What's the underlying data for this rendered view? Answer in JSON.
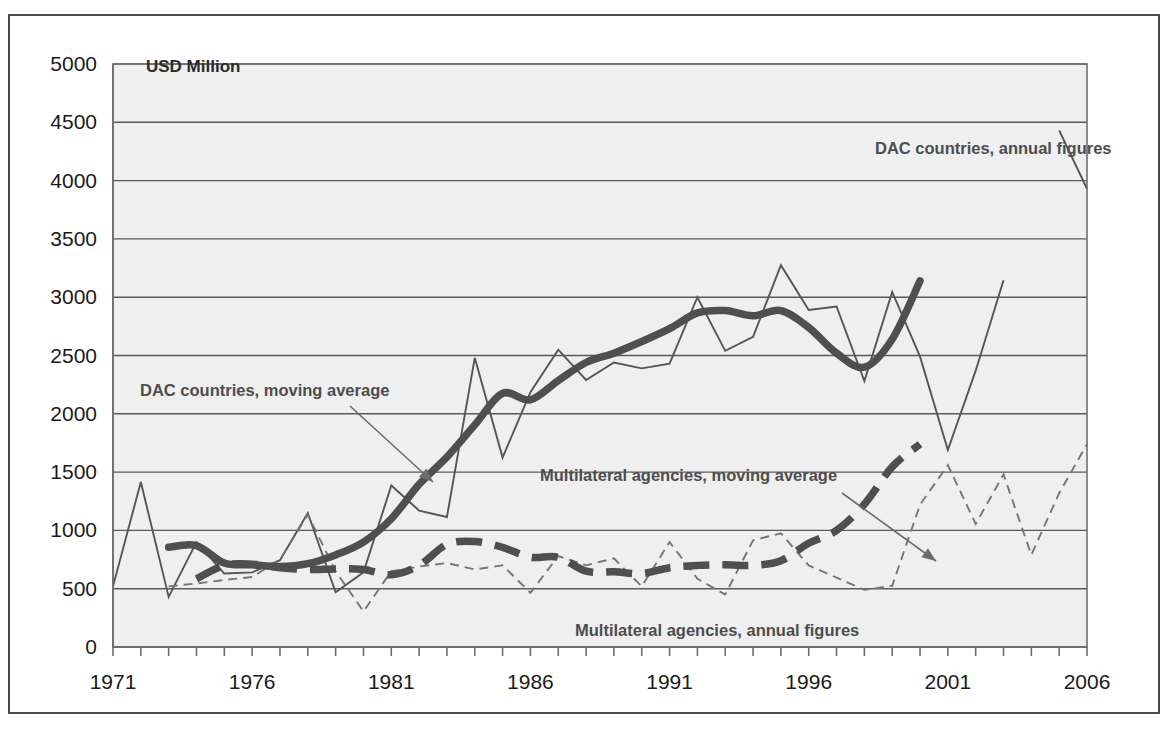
{
  "chart_data": {
    "type": "line",
    "title": "",
    "subtitle": "",
    "xlabel": "",
    "ylabel": "USD Million",
    "unit_label": "USD Million",
    "xlim": [
      1971,
      2006
    ],
    "ylim": [
      0,
      5000
    ],
    "grid": true,
    "legend_position": "inline-annotations",
    "y_ticks": [
      0,
      500,
      1000,
      1500,
      2000,
      2500,
      3000,
      3500,
      4000,
      4500,
      5000
    ],
    "y_tick_labels": [
      "0",
      "500",
      "1000",
      "1500",
      "2000",
      "2500",
      "3000",
      "3500",
      "4000",
      "4500",
      "5000"
    ],
    "x_ticks_labeled": [
      1971,
      1976,
      1981,
      1986,
      1991,
      1996,
      2001,
      2006
    ],
    "x_tick_labels": [
      "1971",
      "1976",
      "1981",
      "1986",
      "1991",
      "1996",
      "2001",
      "2006"
    ],
    "x_minor_tick_interval": 1,
    "x": [
      1971,
      1972,
      1973,
      1974,
      1975,
      1976,
      1977,
      1978,
      1979,
      1980,
      1981,
      1982,
      1983,
      1984,
      1985,
      1986,
      1987,
      1988,
      1989,
      1990,
      1991,
      1992,
      1993,
      1994,
      1995,
      1996,
      1997,
      1998,
      1999,
      2000,
      2001,
      2002,
      2003,
      2004,
      2005,
      2006
    ],
    "series": [
      {
        "name": "DAC countries, annual figures",
        "style": "thin-solid",
        "color": "#555555",
        "values": [
          520,
          1415,
          430,
          900,
          630,
          640,
          745,
          1150,
          470,
          640,
          1385,
          1170,
          1115,
          2480,
          1625,
          2185,
          2550,
          2290,
          2440,
          2390,
          2430,
          3000,
          2540,
          2660,
          3275,
          2890,
          2920,
          2280,
          3045,
          2490,
          1690,
          2370,
          3145,
          null,
          4430,
          3930
        ]
      },
      {
        "name": "DAC countries, moving average",
        "style": "thick-solid",
        "color": "#4f4f4f",
        "values": [
          null,
          null,
          855,
          870,
          720,
          705,
          690,
          715,
          790,
          900,
          1100,
          1395,
          1630,
          1905,
          2175,
          2120,
          2285,
          2440,
          2520,
          2620,
          2730,
          2865,
          2885,
          2840,
          2885,
          2740,
          2520,
          2400,
          2640,
          3140,
          null,
          null,
          null,
          null,
          null,
          null
        ]
      },
      {
        "name": "Multilateral agencies, annual figures",
        "style": "thin-dashed",
        "color": "#757575",
        "values": [
          null,
          null,
          520,
          545,
          575,
          600,
          750,
          1135,
          650,
          305,
          650,
          690,
          720,
          665,
          700,
          465,
          780,
          700,
          760,
          520,
          900,
          585,
          450,
          915,
          975,
          700,
          595,
          490,
          525,
          1220,
          1560,
          1055,
          1480,
          790,
          1320,
          1740
        ]
      },
      {
        "name": "Multilateral agencies, moving average",
        "style": "thick-dashed",
        "color": "#4f4f4f",
        "values": [
          null,
          null,
          null,
          585,
          700,
          710,
          680,
          665,
          670,
          665,
          620,
          700,
          880,
          905,
          855,
          770,
          770,
          650,
          645,
          630,
          680,
          700,
          705,
          700,
          740,
          890,
          1000,
          1225,
          1545,
          1740,
          null,
          null,
          null,
          null,
          null,
          null
        ]
      }
    ],
    "annotations": [
      {
        "id": "dac-annual",
        "text": "DAC countries, annual figures",
        "x": 865,
        "y": 138,
        "anchor": "start",
        "has_leader": false
      },
      {
        "id": "dac-moving-average",
        "text": "DAC countries, moving average",
        "x": 130,
        "y": 380,
        "anchor": "start",
        "has_leader": true,
        "leader_from": [
          340,
          390
        ],
        "leader_to": [
          423,
          466
        ]
      },
      {
        "id": "multilateral-moving-average",
        "text": "Multilateral agencies, moving average",
        "x": 530,
        "y": 465,
        "anchor": "start",
        "has_leader": true,
        "leader_from": [
          832,
          477
        ],
        "leader_to": [
          926,
          545
        ]
      },
      {
        "id": "multilateral-annual",
        "text": "Multilateral agencies, annual figures",
        "x": 565,
        "y": 620,
        "anchor": "start",
        "has_leader": false
      }
    ]
  },
  "colors": {
    "plot_background": "#efefef",
    "gridline": "#5a5a5a",
    "frame": "#4a4a4a",
    "dac_series": "#4f4f4f",
    "multilateral_series": "#757575",
    "text": "#1a1a1a",
    "annotation_text": "#4d4d4d"
  }
}
